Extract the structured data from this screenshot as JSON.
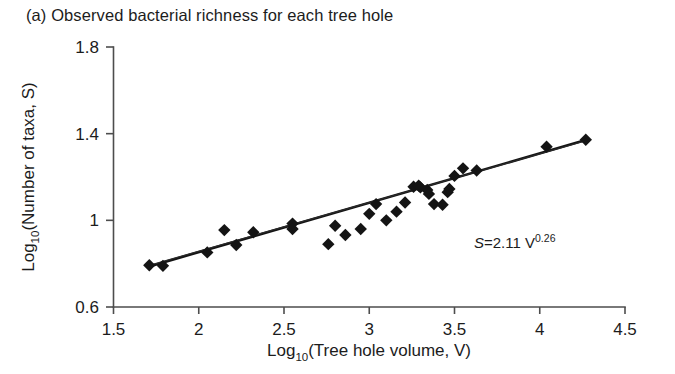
{
  "figure": {
    "panel_label": "(a)",
    "title": "(a) Observed bacterial richness for each tree hole"
  },
  "annotation": {
    "equation_s": "S",
    "equation_eq": "=2.11 V",
    "equation_exponent": "0.26",
    "equation_full": "S = 2.11 V 0.26"
  },
  "axis": {
    "x_title_main": "Log",
    "x_title_sub": "10",
    "x_title_rest": "(Tree hole volume, V)",
    "y_title_main": "Log",
    "y_title_sub": "10",
    "y_title_rest": "(Number of taxa, S)"
  },
  "chart_data": {
    "type": "scatter",
    "title": "(a) Observed bacterial richness for each tree hole",
    "xlabel": "Log10 (Tree hole volume, V)",
    "ylabel": "Log10 (Number of taxa, S)",
    "xlim": [
      1.5,
      4.5
    ],
    "ylim": [
      0.6,
      1.8
    ],
    "xticks": [
      1.5,
      2,
      2.5,
      3,
      3.5,
      4,
      4.5
    ],
    "xticklabels": [
      "1.5",
      "2",
      "2.5",
      "3",
      "3.5",
      "4",
      "4.5"
    ],
    "yticks": [
      0.6,
      1,
      1.4,
      1.8
    ],
    "yticklabels": [
      "0.6",
      "1",
      "1.4",
      "1.8"
    ],
    "grid": false,
    "legend": null,
    "marker": "diamond",
    "marker_color": "#141414",
    "annotations": [
      {
        "text": "S = 2.11 V^0.26",
        "x": 3.92,
        "y": 0.845
      }
    ],
    "series": [
      {
        "name": "Tree holes",
        "points": [
          [
            1.71,
            0.793
          ],
          [
            1.79,
            0.79
          ],
          [
            2.05,
            0.852
          ],
          [
            2.15,
            0.955
          ],
          [
            2.22,
            0.886
          ],
          [
            2.32,
            0.945
          ],
          [
            2.55,
            0.985
          ],
          [
            2.55,
            0.96
          ],
          [
            2.76,
            0.89
          ],
          [
            2.8,
            0.975
          ],
          [
            2.86,
            0.932
          ],
          [
            2.95,
            0.96
          ],
          [
            3.0,
            1.03
          ],
          [
            3.04,
            1.075
          ],
          [
            3.1,
            1.0
          ],
          [
            3.16,
            1.04
          ],
          [
            3.21,
            1.082
          ],
          [
            3.26,
            1.155
          ],
          [
            3.29,
            1.16
          ],
          [
            3.3,
            1.152
          ],
          [
            3.34,
            1.14
          ],
          [
            3.35,
            1.122
          ],
          [
            3.38,
            1.075
          ],
          [
            3.43,
            1.072
          ],
          [
            3.46,
            1.13
          ],
          [
            3.47,
            1.145
          ],
          [
            3.5,
            1.205
          ],
          [
            3.55,
            1.24
          ],
          [
            3.63,
            1.23
          ],
          [
            4.04,
            1.34
          ],
          [
            4.27,
            1.372
          ]
        ]
      }
    ],
    "fit_lines": [
      {
        "name": "fit-thick",
        "style": "thick",
        "x": [
          1.7,
          4.29
        ],
        "y": [
          0.785,
          1.375
        ]
      },
      {
        "name": "fit-thin",
        "style": "thin",
        "x": [
          1.7,
          4.29
        ],
        "y": [
          0.79,
          1.372
        ]
      }
    ]
  }
}
